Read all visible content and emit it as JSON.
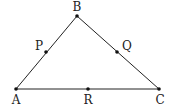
{
  "diagram": {
    "type": "triangle",
    "stroke_color": "#222222",
    "background": "#ffffff",
    "vertices": [
      {
        "id": "A",
        "label": "A",
        "x": 16,
        "y": 89
      },
      {
        "id": "B",
        "label": "B",
        "x": 77,
        "y": 16
      },
      {
        "id": "C",
        "label": "C",
        "x": 159,
        "y": 89
      }
    ],
    "edges": [
      {
        "from": "A",
        "to": "B"
      },
      {
        "from": "B",
        "to": "C"
      },
      {
        "from": "A",
        "to": "C"
      }
    ],
    "points": [
      {
        "id": "P",
        "label": "P",
        "on_edge": "AB",
        "x": 46,
        "y": 52
      },
      {
        "id": "Q",
        "label": "Q",
        "on_edge": "BC",
        "x": 117,
        "y": 52
      },
      {
        "id": "R",
        "label": "R",
        "on_edge": "AC",
        "x": 88,
        "y": 89
      }
    ],
    "labels": {
      "A": "A",
      "B": "B",
      "C": "C",
      "P": "P",
      "Q": "Q",
      "R": "R"
    }
  }
}
